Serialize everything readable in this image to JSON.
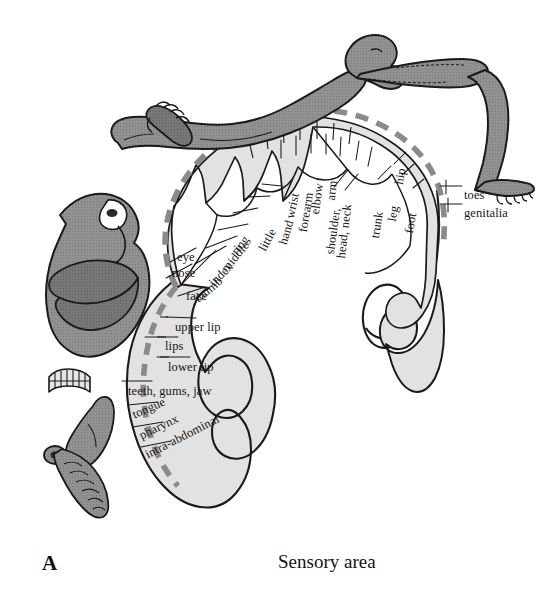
{
  "figure": {
    "panel_letter": "A",
    "caption": "Sensory area",
    "colors": {
      "cortex_fill": "#e2e2e2",
      "cortex_outline": "#1a1a1a",
      "homunculus_fill": "#8f8f8f",
      "homunculus_shadow": "#6e6e6e",
      "dashed_border": "#8a8a8a",
      "leader_line": "#1a1a1a",
      "background": "#ffffff",
      "text": "#171717"
    }
  },
  "labels": {
    "rotated": [
      {
        "text": "little",
        "x": 262,
        "y": 244,
        "angle": -62
      },
      {
        "text": "ring",
        "x": 234,
        "y": 247,
        "angle": -52
      },
      {
        "text": "middle",
        "x": 224,
        "y": 264,
        "angle": -50
      },
      {
        "text": "index",
        "x": 211,
        "y": 278,
        "angle": -44
      },
      {
        "text": "thumb",
        "x": 196,
        "y": 294,
        "angle": -40
      },
      {
        "text": "hand",
        "x": 283,
        "y": 238,
        "angle": -74
      },
      {
        "text": "wrist",
        "x": 290,
        "y": 212,
        "angle": -78
      },
      {
        "text": "forearm",
        "x": 303,
        "y": 226,
        "angle": -81
      },
      {
        "text": "elbow",
        "x": 315,
        "y": 208,
        "angle": -82
      },
      {
        "text": "arm",
        "x": 331,
        "y": 194,
        "angle": -84
      },
      {
        "text": "shoulder,",
        "x": 330,
        "y": 248,
        "angle": -82
      },
      {
        "text": "head, neck",
        "x": 341,
        "y": 252,
        "angle": -83
      },
      {
        "text": "trunk",
        "x": 375,
        "y": 232,
        "angle": -81
      },
      {
        "text": "leg",
        "x": 392,
        "y": 215,
        "angle": -80
      },
      {
        "text": "hip",
        "x": 399,
        "y": 178,
        "angle": -80
      },
      {
        "text": "foot",
        "x": 409,
        "y": 227,
        "angle": -80
      }
    ],
    "horizontal": [
      {
        "text": "eye",
        "x": 177,
        "y": 251
      },
      {
        "text": "nose",
        "x": 172,
        "y": 267
      },
      {
        "text": "face",
        "x": 186,
        "y": 290
      },
      {
        "text": "upper lip",
        "x": 175,
        "y": 321
      },
      {
        "text": "lips",
        "x": 165,
        "y": 340
      },
      {
        "text": "lower lip",
        "x": 168,
        "y": 361
      },
      {
        "text": "teeth, gums, jaw",
        "x": 128,
        "y": 385
      },
      {
        "text": "toes",
        "x": 464,
        "y": 189
      },
      {
        "text": "genitalia",
        "x": 464,
        "y": 207
      }
    ],
    "rotated_lower": [
      {
        "text": "tongue",
        "x": 133,
        "y": 409,
        "angle": -24
      },
      {
        "text": "pharynx",
        "x": 140,
        "y": 430,
        "angle": -26
      },
      {
        "text": "intra-abdominal",
        "x": 146,
        "y": 449,
        "angle": -27
      }
    ]
  }
}
